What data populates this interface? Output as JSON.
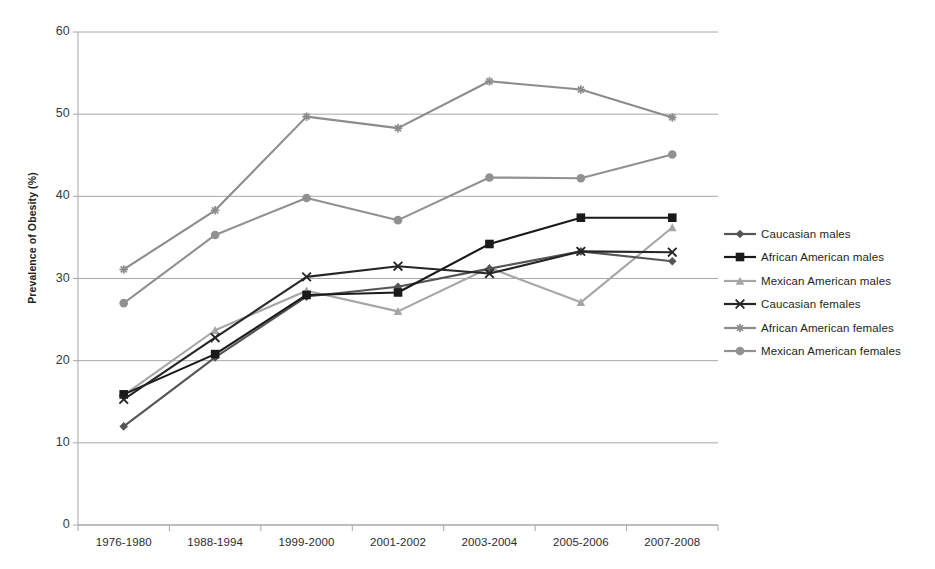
{
  "chart_data": {
    "type": "line",
    "title": "",
    "xlabel": "",
    "ylabel": "Prevalence of Obesity (%)",
    "ylim": [
      0,
      60
    ],
    "yticks": [
      0,
      10,
      20,
      30,
      40,
      50,
      60
    ],
    "grid": true,
    "legend_position": "right",
    "categories": [
      "1976-1980",
      "1988-1994",
      "1999-2000",
      "2001-2002",
      "2003-2004",
      "2005-2006",
      "2007-2008"
    ],
    "series": [
      {
        "name": "Caucasian males",
        "marker": "diamond",
        "color": "#555555",
        "values": [
          12.0,
          20.4,
          27.8,
          29.0,
          31.2,
          33.3,
          32.1
        ]
      },
      {
        "name": "African American males",
        "marker": "square",
        "color": "#1a1a1a",
        "values": [
          15.9,
          20.8,
          28.0,
          28.3,
          34.2,
          37.4,
          37.4
        ]
      },
      {
        "name": "Mexican American males",
        "marker": "triangle",
        "color": "#a6a6a6",
        "values": [
          15.8,
          23.7,
          28.5,
          26.0,
          31.3,
          27.1,
          36.2
        ]
      },
      {
        "name": "Caucasian females",
        "marker": "x",
        "color": "#262626",
        "values": [
          15.3,
          22.8,
          30.2,
          31.5,
          30.6,
          33.3,
          33.2
        ]
      },
      {
        "name": "African American females",
        "marker": "asterisk",
        "color": "#8c8c8c",
        "values": [
          31.1,
          38.3,
          49.7,
          48.3,
          54.0,
          53.0,
          49.6
        ]
      },
      {
        "name": "Mexican American females",
        "marker": "circle",
        "color": "#919191",
        "values": [
          27.0,
          35.3,
          39.8,
          37.1,
          42.3,
          42.2,
          45.1
        ]
      }
    ]
  },
  "axis": {
    "y_label": "Prevalence of Obesity (%)"
  },
  "colors": {
    "grid": "#a8a8a8",
    "axis": "#a8a8a8",
    "text": "#231f20",
    "background": "#ffffff"
  }
}
